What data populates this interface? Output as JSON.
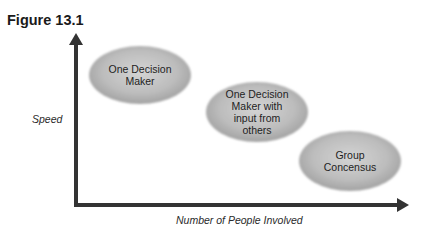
{
  "figure": {
    "title": "Figure 13.1"
  },
  "axes": {
    "y_label": "Speed",
    "x_label": "Number of People Involved"
  },
  "nodes": [
    {
      "id": "one-decision-maker",
      "lines": [
        "One Decision",
        "Maker"
      ],
      "cx": 140,
      "cy": 75
    },
    {
      "id": "one-decision-maker-with-input",
      "lines": [
        "One Decision",
        "Maker with",
        "input from",
        "others"
      ],
      "cx": 257,
      "cy": 112
    },
    {
      "id": "group-consensus",
      "lines": [
        "Group",
        "Concensus"
      ],
      "cx": 350,
      "cy": 161
    }
  ],
  "colors": {
    "axis": "#333333",
    "ellipse_fill_light": "#d9d9d9",
    "ellipse_fill_dark": "#9a9a9a",
    "text": "#1e1e1e"
  }
}
